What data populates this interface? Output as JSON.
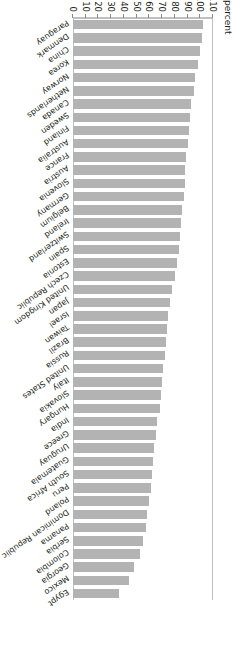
{
  "chart_data": {
    "type": "bar",
    "title": "",
    "subtitle": "",
    "xlabel": "",
    "ylabel": "percent",
    "ylim": [
      0,
      110
    ],
    "yticks": [
      0,
      10,
      20,
      30,
      40,
      50,
      60,
      70,
      80,
      90,
      100,
      110
    ],
    "grid": false,
    "legend": null,
    "orientation": "horizontal-bars-rotated",
    "bar_color": "#b3b3b3",
    "categories": [
      "Paraguay",
      "Denmark",
      "China",
      "Korea",
      "Norway",
      "Netherlands",
      "Canada",
      "Sweden",
      "Finland",
      "Australia",
      "France",
      "Austria",
      "Slovenia",
      "Germany",
      "Belgium",
      "Ireland",
      "Switzerland",
      "Spain",
      "Estonia",
      "Czech Republic",
      "United Kingdom",
      "Japan",
      "Israel",
      "Taiwan",
      "Brazil",
      "Russia",
      "United States",
      "Italy",
      "Slovakia",
      "Hungary",
      "India",
      "Greece",
      "Uruguay",
      "Guatemala",
      "South Africa",
      "Peru",
      "Poland",
      "Dominican Republic",
      "Panama",
      "Serbia",
      "Colombia",
      "Georgia",
      "Mexico",
      "Egypt"
    ],
    "values": [
      102,
      101,
      100,
      98,
      96,
      95,
      93,
      92,
      91,
      90,
      89,
      88,
      88,
      87,
      86,
      85,
      84,
      83,
      82,
      80,
      78,
      76,
      75,
      74,
      73,
      72,
      71,
      70,
      69,
      68,
      66,
      65,
      64,
      63,
      62,
      61,
      60,
      58,
      57,
      55,
      53,
      48,
      44,
      36
    ]
  },
  "axis": {
    "title": "percent",
    "tick_labels": [
      "110",
      "100",
      "90",
      "80",
      "70",
      "60",
      "50",
      "40",
      "30",
      "20",
      "10",
      "0"
    ]
  }
}
